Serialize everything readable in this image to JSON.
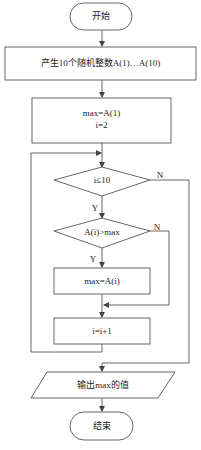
{
  "flowchart": {
    "start": {
      "label": "开始"
    },
    "generate": {
      "label": "产生10个随机整数A(1)…A(10)"
    },
    "init": {
      "line1": "max=A(1)",
      "line2": "i=2"
    },
    "loop_condition": {
      "label": "i≤10",
      "yes": "Y",
      "no": "N"
    },
    "compare_condition": {
      "label": "A(i)>max",
      "yes": "Y",
      "no": "N"
    },
    "assign": {
      "label": "max=A(i)"
    },
    "increment": {
      "label": "i=i+1"
    },
    "output": {
      "label": "输出max的值"
    },
    "end": {
      "label": "结束"
    }
  },
  "colors": {
    "stroke": "#555555",
    "text": "#222222",
    "background": "#ffffff"
  }
}
